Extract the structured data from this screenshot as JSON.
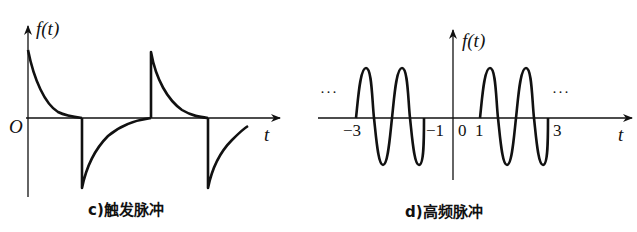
{
  "panels": [
    {
      "id": "c",
      "caption": "c)触发脉冲",
      "y_label": "f(t)",
      "x_label": "t",
      "origin_label": "O",
      "description": "Trigger pulse: alternating exponentially decaying positive and negative spikes"
    },
    {
      "id": "d",
      "caption": "d)高频脉冲",
      "y_label": "f(t)",
      "x_label": "t",
      "tick_labels": [
        "−3",
        "−1",
        "0",
        "1",
        "3"
      ],
      "ellipsis_left": "···",
      "ellipsis_right": "···",
      "description": "High-frequency pulse: bursts of sinusoidal oscillation on [-3,-1] and [1,3], periodic"
    }
  ],
  "colors": {
    "stroke": "#111111",
    "background": "#ffffff"
  }
}
